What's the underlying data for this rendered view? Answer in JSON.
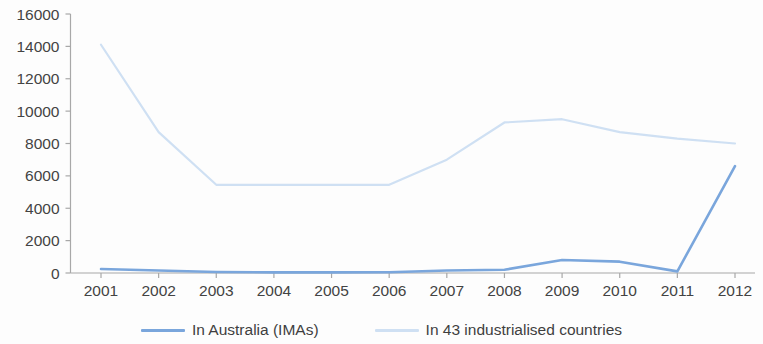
{
  "chart_data": {
    "type": "line",
    "title": "",
    "xlabel": "",
    "ylabel": "",
    "categories": [
      "2001",
      "2002",
      "2003",
      "2004",
      "2005",
      "2006",
      "2007",
      "2008",
      "2009",
      "2010",
      "2011",
      "2012"
    ],
    "ylim": [
      0,
      16000
    ],
    "ytick_values": [
      0,
      2000,
      4000,
      6000,
      8000,
      10000,
      12000,
      14000,
      16000
    ],
    "ytick_labels": [
      "0",
      "2000",
      "4000",
      "6000",
      "8000",
      "10000",
      "12000",
      "14000",
      "16000"
    ],
    "grid": false,
    "legend_position": "bottom",
    "series": [
      {
        "name": "In Australia (IMAs)",
        "color": "#7aa6dc",
        "values": [
          250,
          150,
          60,
          40,
          40,
          50,
          150,
          200,
          800,
          700,
          100,
          6600
        ]
      },
      {
        "name": "In 43 industrialised countries",
        "color": "#cfe0f3",
        "values": [
          14100,
          8700,
          5450,
          5450,
          5450,
          5450,
          7000,
          9300,
          9500,
          8700,
          8300,
          8000
        ]
      }
    ]
  },
  "axes": {
    "y_axis_name": "y-axis",
    "x_axis_name": "x-axis"
  },
  "legend": {
    "items": [
      {
        "label": "In Australia (IMAs)",
        "color": "#7aa6dc"
      },
      {
        "label": "In 43 industrialised countries",
        "color": "#cfe0f3"
      }
    ]
  }
}
